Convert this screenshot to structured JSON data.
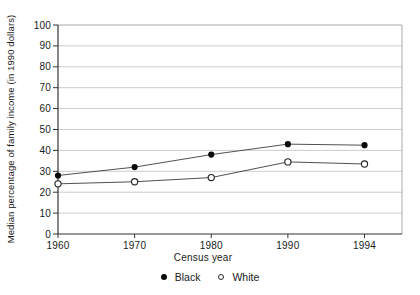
{
  "chart_data": {
    "type": "line",
    "title": "",
    "xlabel": "Census year",
    "ylabel": "Median percentage of family income (in 1990 dollars)",
    "categories": [
      "1960",
      "1970",
      "1980",
      "1990",
      "1994"
    ],
    "x_axis_style": "categorical, equally spaced ticks",
    "y_ticks": [
      0,
      10,
      20,
      30,
      40,
      50,
      60,
      70,
      80,
      90,
      100
    ],
    "ylim": [
      0,
      100
    ],
    "grid": "horizontal gridlines every 10 units",
    "legend_position": "bottom-center",
    "series": [
      {
        "name": "Black",
        "marker": "filled-circle",
        "values": [
          28,
          32,
          38,
          43,
          42.5
        ]
      },
      {
        "name": "White",
        "marker": "open-circle",
        "values": [
          24,
          25,
          27,
          34.5,
          33.5
        ]
      }
    ]
  },
  "colors": {
    "background": "#ffffff",
    "text": "#1a1a1a",
    "grid": "#cccccc",
    "frame": "#aaaaaa",
    "axis": "#333333",
    "line": "#3d3d3d",
    "marker_fill": "#0a0a0a",
    "marker_open_fill": "#ffffff"
  }
}
